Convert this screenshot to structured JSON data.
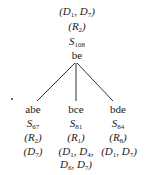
{
  "root": {
    "cond": {
      "sym": "D",
      "a": "1",
      "b": "7"
    },
    "rule": {
      "sym": "R",
      "sub": "2"
    },
    "state": {
      "sym": "S",
      "sub": "108"
    },
    "name": "be"
  },
  "children": [
    {
      "name": "abe",
      "state": {
        "sym": "S",
        "sub": "67"
      },
      "rule": {
        "sym": "R",
        "sub": "2"
      },
      "cond_line1": "D",
      "cond_sub1": "7"
    },
    {
      "name": "bce",
      "state": {
        "sym": "S",
        "sub": "81"
      },
      "rule": {
        "sym": "R",
        "sub": "1"
      },
      "conds": [
        {
          "sym": "D",
          "sub": "1"
        },
        {
          "sym": "D",
          "sub": "4"
        },
        {
          "sym": "D",
          "sub": "6"
        },
        {
          "sym": "D",
          "sub": "7"
        }
      ]
    },
    {
      "name": "bde",
      "state": {
        "sym": "S",
        "sub": "84"
      },
      "rule": {
        "sym": "R",
        "sub": "8"
      },
      "conds": [
        {
          "sym": "D",
          "sub": "1"
        },
        {
          "sym": "D",
          "sub": "7"
        }
      ]
    }
  ],
  "colors": {
    "ink": "#1a1a1a",
    "background": "#ffffff"
  }
}
